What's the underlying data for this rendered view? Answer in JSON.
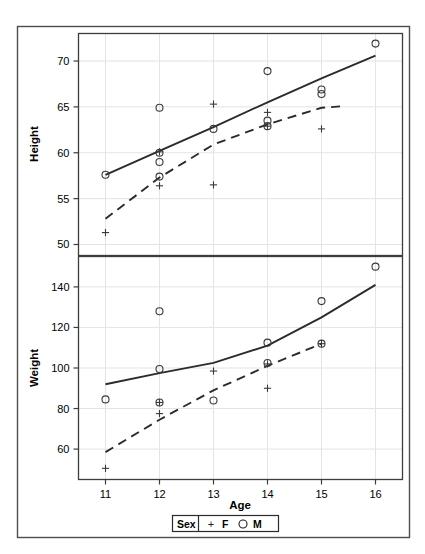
{
  "figure": {
    "x_axis_label": "Age",
    "legend": {
      "title": "Sex",
      "entries": [
        {
          "symbol": "+",
          "label": "F"
        },
        {
          "symbol": "○",
          "label": "M"
        }
      ]
    },
    "colors": {
      "frame": "#4d4d4d",
      "grid": "#e3e3e8",
      "marker": "#3a3a3a",
      "fit_male": "#2b2b2b",
      "fit_female": "#2b2b2b",
      "text": "#000000"
    }
  },
  "chart_data": [
    {
      "type": "scatter",
      "panel": "top",
      "title": "",
      "xlabel": "Age",
      "ylabel": "Height",
      "xlim": [
        10.5,
        16.5
      ],
      "ylim": [
        48.8,
        73.0
      ],
      "xticks": [
        11,
        12,
        13,
        14,
        15,
        16
      ],
      "yticks": [
        50,
        55,
        60,
        65,
        70
      ],
      "grid": true,
      "legend_position": "bottom",
      "series": [
        {
          "name": "M",
          "marker": "circle",
          "points": [
            {
              "x": 11,
              "y": 57.6
            },
            {
              "x": 12,
              "y": 64.9
            },
            {
              "x": 12,
              "y": 60.0
            },
            {
              "x": 12,
              "y": 59.0
            },
            {
              "x": 12,
              "y": 57.4
            },
            {
              "x": 13,
              "y": 62.6
            },
            {
              "x": 14,
              "y": 68.9
            },
            {
              "x": 14,
              "y": 63.5
            },
            {
              "x": 14,
              "y": 62.9
            },
            {
              "x": 15,
              "y": 66.9
            },
            {
              "x": 15,
              "y": 66.4
            },
            {
              "x": 16,
              "y": 71.9
            }
          ]
        },
        {
          "name": "F",
          "marker": "plus",
          "points": [
            {
              "x": 11,
              "y": 51.3
            },
            {
              "x": 12,
              "y": 60.1
            },
            {
              "x": 12,
              "y": 56.4
            },
            {
              "x": 13,
              "y": 65.3
            },
            {
              "x": 13,
              "y": 56.5
            },
            {
              "x": 14,
              "y": 64.4
            },
            {
              "x": 14,
              "y": 62.9
            },
            {
              "x": 15,
              "y": 62.6
            }
          ]
        }
      ],
      "fits": [
        {
          "name": "M",
          "style": "solid",
          "points": [
            {
              "x": 11.0,
              "y": 57.6
            },
            {
              "x": 12.0,
              "y": 60.2
            },
            {
              "x": 13.0,
              "y": 62.8
            },
            {
              "x": 14.0,
              "y": 65.5
            },
            {
              "x": 15.0,
              "y": 68.1
            },
            {
              "x": 16.0,
              "y": 70.6
            }
          ]
        },
        {
          "name": "F",
          "style": "dashed",
          "points": [
            {
              "x": 11.0,
              "y": 52.8
            },
            {
              "x": 12.0,
              "y": 57.3
            },
            {
              "x": 13.0,
              "y": 60.9
            },
            {
              "x": 14.0,
              "y": 63.1
            },
            {
              "x": 15.0,
              "y": 64.9
            },
            {
              "x": 15.45,
              "y": 65.1
            }
          ]
        }
      ]
    },
    {
      "type": "scatter",
      "panel": "bottom",
      "title": "",
      "xlabel": "Age",
      "ylabel": "Weight",
      "xlim": [
        10.5,
        16.5
      ],
      "ylim": [
        45.0,
        155.0
      ],
      "xticks": [
        11,
        12,
        13,
        14,
        15,
        16
      ],
      "yticks": [
        60,
        80,
        100,
        120,
        140
      ],
      "grid": true,
      "legend_position": "bottom",
      "series": [
        {
          "name": "M",
          "marker": "circle",
          "points": [
            {
              "x": 11,
              "y": 84.5
            },
            {
              "x": 12,
              "y": 128.0
            },
            {
              "x": 12,
              "y": 99.5
            },
            {
              "x": 12,
              "y": 83.0
            },
            {
              "x": 13,
              "y": 84.0
            },
            {
              "x": 14,
              "y": 112.5
            },
            {
              "x": 14,
              "y": 102.5
            },
            {
              "x": 15,
              "y": 133.0
            },
            {
              "x": 15,
              "y": 112.0
            },
            {
              "x": 16,
              "y": 150.0
            }
          ]
        },
        {
          "name": "F",
          "marker": "plus",
          "points": [
            {
              "x": 11,
              "y": 50.5
            },
            {
              "x": 12,
              "y": 83.0
            },
            {
              "x": 12,
              "y": 77.5
            },
            {
              "x": 13,
              "y": 98.5
            },
            {
              "x": 14,
              "y": 102.0
            },
            {
              "x": 14,
              "y": 90.0
            },
            {
              "x": 15,
              "y": 112.0
            }
          ]
        }
      ],
      "fits": [
        {
          "name": "M",
          "style": "solid",
          "points": [
            {
              "x": 11.0,
              "y": 92.0
            },
            {
              "x": 12.0,
              "y": 97.5
            },
            {
              "x": 13.0,
              "y": 102.5
            },
            {
              "x": 14.0,
              "y": 111.0
            },
            {
              "x": 15.0,
              "y": 125.0
            },
            {
              "x": 16.0,
              "y": 141.0
            }
          ]
        },
        {
          "name": "F",
          "style": "dashed",
          "points": [
            {
              "x": 11.0,
              "y": 58.5
            },
            {
              "x": 12.0,
              "y": 74.5
            },
            {
              "x": 13.0,
              "y": 89.0
            },
            {
              "x": 14.0,
              "y": 101.0
            },
            {
              "x": 15.0,
              "y": 112.0
            }
          ]
        }
      ]
    }
  ]
}
